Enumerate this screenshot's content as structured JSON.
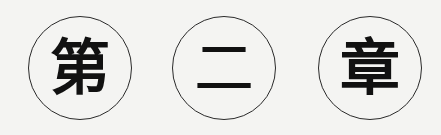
{
  "heading": {
    "characters": [
      "第",
      "二",
      "章"
    ],
    "meaning": "Chapter Two"
  }
}
